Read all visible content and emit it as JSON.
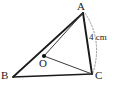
{
  "figure": {
    "type": "geometry-diagram",
    "background_color": "#ffffff",
    "stroke_color": "#1a1a1a",
    "dashed_color": "#8a8a8a",
    "width": 119,
    "height": 99
  },
  "labels": {
    "vertex_a": "A",
    "vertex_b": "B",
    "vertex_c": "C",
    "point_o": "O",
    "measure": "4 cm"
  },
  "points": {
    "A": {
      "x": 83,
      "y": 13
    },
    "B": {
      "x": 13,
      "y": 77
    },
    "C": {
      "x": 92,
      "y": 74
    },
    "O": {
      "x": 44,
      "y": 56
    }
  },
  "segments": [
    {
      "name": "AB",
      "from": "A",
      "to": "B",
      "style": "solid",
      "weight": 1.6
    },
    {
      "name": "BC",
      "from": "B",
      "to": "C",
      "style": "solid",
      "weight": 1.6
    },
    {
      "name": "CA",
      "from": "C",
      "to": "A",
      "style": "solid",
      "weight": 1.8
    },
    {
      "name": "AO",
      "from": "A",
      "to": "O",
      "style": "solid",
      "weight": 1.0
    },
    {
      "name": "OC",
      "from": "O",
      "to": "C",
      "style": "solid",
      "weight": 1.0
    }
  ],
  "arcs": [
    {
      "name": "measure-arc-AC",
      "from": "A",
      "to": "C",
      "style": "dashed",
      "label": "4 cm"
    }
  ]
}
